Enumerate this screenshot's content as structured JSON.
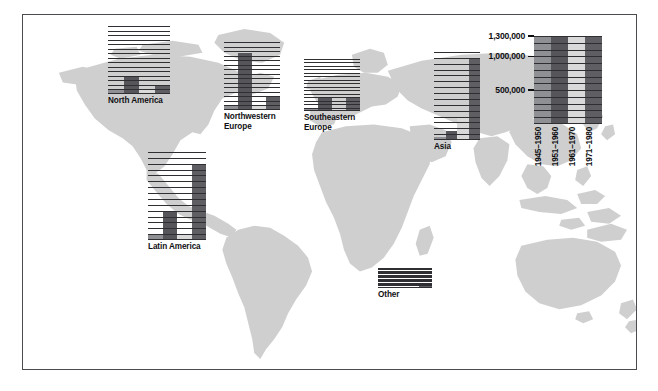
{
  "figure": {
    "background_color": "#ffffff",
    "frame_border_color": "#4b4b50",
    "land_color": "#cfcfcf"
  },
  "palette": {
    "period_1": "#8f9094",
    "period_2": "#55555a",
    "period_3": "#d9d9d9",
    "period_4": "#5e5e63",
    "gridline": "#ffffff",
    "axis": "#2f2f33",
    "text": "#0e0e11"
  },
  "scale_legend": {
    "name": "scale-legend",
    "axis_max": 1500000,
    "tick_labels": [
      {
        "value": 1300000,
        "text": "1,300,000"
      },
      {
        "value": 1000000,
        "text": "1,000,000"
      },
      {
        "value": 500000,
        "text": "500,000"
      }
    ],
    "minor_tick_step": 100000,
    "periods": [
      {
        "label": "1945–1950",
        "color": "#8f9094"
      },
      {
        "label": "1951–1960",
        "color": "#55555a"
      },
      {
        "label": "1961–1970",
        "color": "#d9d9d9"
      },
      {
        "label": "1971–1980",
        "color": "#5e5e63"
      }
    ]
  },
  "chart_data": {
    "type": "bar",
    "title": "",
    "xlabel": "",
    "ylabel": "",
    "ylim": [
      0,
      1500000
    ],
    "grid": true,
    "legend_position": "right",
    "categories": [
      "1945–1950",
      "1951–1960",
      "1961–1970",
      "1971–1980"
    ],
    "series": [
      {
        "name": "North America",
        "values": [
          100000,
          400000,
          100000,
          200000
        ]
      },
      {
        "name": "Northwestern Europe",
        "values": [
          100000,
          1250000,
          100000,
          300000
        ]
      },
      {
        "name": "Southeastern Europe",
        "values": [
          100000,
          400000,
          100000,
          400000
        ]
      },
      {
        "name": "Asia",
        "values": [
          50000,
          150000,
          400000,
          1400000
        ]
      },
      {
        "name": "Latin America",
        "values": [
          100000,
          500000,
          100000,
          1300000
        ]
      },
      {
        "name": "Other",
        "values": [
          20000,
          40000,
          80000,
          150000
        ]
      }
    ]
  },
  "panels": [
    {
      "name": "north-america",
      "label": "North America",
      "label_lines": "North America",
      "x": 108,
      "y": 26,
      "w": 62,
      "h": 68,
      "label_x": 108,
      "label_y": 95,
      "values": [
        100000,
        400000,
        100000,
        200000
      ]
    },
    {
      "name": "northwestern-europe",
      "label": "Northwestern Europe",
      "label_lines": "Northwestern\nEurope",
      "x": 224,
      "y": 42,
      "w": 56,
      "h": 68,
      "label_x": 224,
      "label_y": 111,
      "values": [
        100000,
        1250000,
        100000,
        300000
      ]
    },
    {
      "name": "southeastern-europe",
      "label": "Southeastern Europe",
      "label_lines": "Southeastern\nEurope",
      "x": 304,
      "y": 59,
      "w": 56,
      "h": 52,
      "label_x": 304,
      "label_y": 112,
      "values": [
        100000,
        400000,
        100000,
        400000
      ]
    },
    {
      "name": "asia",
      "label": "Asia",
      "label_lines": "Asia",
      "x": 434,
      "y": 52,
      "w": 46,
      "h": 88,
      "label_x": 434,
      "label_y": 141,
      "values": [
        50000,
        150000,
        400000,
        1400000
      ]
    },
    {
      "name": "latin-america",
      "label": "Latin America",
      "label_lines": "Latin America",
      "x": 148,
      "y": 152,
      "w": 58,
      "h": 88,
      "label_x": 144,
      "label_y": 241,
      "values": [
        100000,
        500000,
        100000,
        1300000
      ]
    },
    {
      "name": "other",
      "label": "Other",
      "label_lines": "Other",
      "x": 378,
      "y": 268,
      "w": 54,
      "h": 20,
      "label_x": 378,
      "label_y": 289,
      "values": [
        20000,
        40000,
        80000,
        150000
      ]
    }
  ]
}
